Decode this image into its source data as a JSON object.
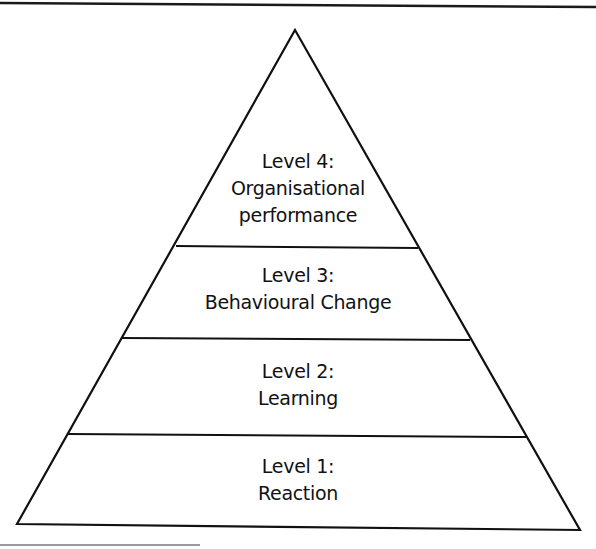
{
  "diagram": {
    "type": "pyramid",
    "stroke_color": "#111111",
    "background": "#ffffff",
    "levels": [
      {
        "id": "level-4",
        "lines": [
          "Level 4:",
          "Organisational",
          "performance"
        ]
      },
      {
        "id": "level-3",
        "lines": [
          "Level 3:",
          "Behavioural Change"
        ]
      },
      {
        "id": "level-2",
        "lines": [
          "Level 2:",
          "Learning"
        ]
      },
      {
        "id": "level-1",
        "lines": [
          "Level 1:",
          "Reaction"
        ]
      }
    ]
  }
}
